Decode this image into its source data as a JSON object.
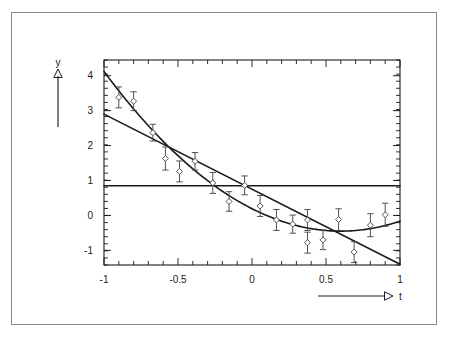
{
  "figure": {
    "background_color": "#ffffff",
    "border_color": "#8a8a8a",
    "ink_color": "#1a1a1a",
    "marker_color": "#4a4a4a"
  },
  "axes": {
    "x_label": "t",
    "y_label": "y",
    "x_tick_labels": [
      "-1",
      "-0.5",
      "0",
      "0.5",
      "1"
    ],
    "x_tick_values": [
      -1,
      -0.5,
      0,
      0.5,
      1
    ],
    "y_tick_labels": [
      "4",
      "3",
      "2",
      "1",
      "0",
      "-1"
    ],
    "y_tick_values": [
      4,
      3,
      2,
      1,
      0,
      -1
    ],
    "x_arrow_label": "t",
    "y_arrow_label": "y"
  },
  "chart_data": {
    "type": "scatter",
    "title": "",
    "subtitle": "",
    "xlabel": "t",
    "ylabel": "y",
    "xlim": [
      -1,
      1
    ],
    "ylim": [
      -1.42,
      4.45
    ],
    "grid": false,
    "legend": null,
    "legend_position": "none",
    "x_ticks": [
      -1,
      -0.5,
      0,
      0.5,
      1
    ],
    "y_ticks": [
      4,
      3,
      2,
      1,
      0,
      -1
    ],
    "x_minor_tick_count": 20,
    "y_minor_tick_count": 29,
    "series": [
      {
        "name": "data",
        "type": "scatter_errorbar",
        "marker": "open-diamond",
        "points": [
          {
            "x": -0.9,
            "y": 3.38,
            "yerr": 0.3
          },
          {
            "x": -0.8,
            "y": 3.27,
            "yerr": 0.27
          },
          {
            "x": -0.67,
            "y": 2.37,
            "yerr": 0.24
          },
          {
            "x": -0.585,
            "y": 1.63,
            "yerr": 0.33
          },
          {
            "x": -0.49,
            "y": 1.26,
            "yerr": 0.3
          },
          {
            "x": -0.385,
            "y": 1.55,
            "yerr": 0.25
          },
          {
            "x": -0.265,
            "y": 0.93,
            "yerr": 0.3
          },
          {
            "x": -0.155,
            "y": 0.4,
            "yerr": 0.28
          },
          {
            "x": -0.05,
            "y": 0.86,
            "yerr": 0.27
          },
          {
            "x": 0.055,
            "y": 0.27,
            "yerr": 0.3
          },
          {
            "x": 0.165,
            "y": -0.13,
            "yerr": 0.3
          },
          {
            "x": 0.275,
            "y": -0.25,
            "yerr": 0.26
          },
          {
            "x": 0.375,
            "y": -0.78,
            "yerr": 0.3
          },
          {
            "x": 0.375,
            "y": -0.13,
            "yerr": 0.3
          },
          {
            "x": 0.48,
            "y": -0.7,
            "yerr": 0.28
          },
          {
            "x": 0.585,
            "y": -0.12,
            "yerr": 0.31
          },
          {
            "x": 0.69,
            "y": -1.05,
            "yerr": 0.3
          },
          {
            "x": 0.8,
            "y": -0.28,
            "yerr": 0.33
          },
          {
            "x": 0.9,
            "y": 0.02,
            "yerr": 0.33
          }
        ]
      },
      {
        "name": "constant-fit",
        "type": "line",
        "description": "horizontal constant fit",
        "equation": "y = 0.85",
        "constant": 0.85,
        "x_from": -1,
        "x_to": 1
      },
      {
        "name": "linear-fit",
        "type": "line",
        "description": "straight line fit",
        "equation": "y = 0.75 - 2.15 t",
        "y_at_xmin": 2.9,
        "y_at_xmax": -1.4,
        "x_from": -1,
        "x_to": 1
      },
      {
        "name": "quadratic-fit",
        "type": "curve",
        "description": "parabola fit",
        "equation": "y = 0.14 - 2.30 t + 1.85 t^2",
        "vertex_x": 0.6,
        "vertex_y": -0.45,
        "y_at_xmin": 4.12,
        "y_at_xmax": -0.2,
        "x_from": -1,
        "x_to": 1
      }
    ]
  }
}
